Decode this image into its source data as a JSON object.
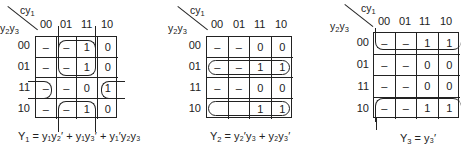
{
  "kmaps": [
    {
      "id": "Y1",
      "col_var": "cy",
      "col_var_sub": "1",
      "row_var_a": "y",
      "row_var_a_sub": "2",
      "row_var_b": "y",
      "row_var_b_sub": "3",
      "col_headers": [
        "00",
        "01",
        "11",
        "10"
      ],
      "row_headers": [
        "00",
        "01",
        "11",
        "10"
      ],
      "cells": [
        [
          "–",
          "–",
          "1",
          "0"
        ],
        [
          "–",
          "–",
          "1",
          "0"
        ],
        [
          "–",
          "–",
          "0",
          "1"
        ],
        [
          "–",
          "–",
          "1",
          "0"
        ]
      ],
      "equation": {
        "lhs": "Y",
        "lhs_sub": "1",
        "terms": [
          "y₁y₂′",
          "y₁y₃′",
          "y₁′y₂y₃"
        ]
      }
    },
    {
      "id": "Y2",
      "col_var": "cy",
      "col_var_sub": "1",
      "row_var_a": "y",
      "row_var_a_sub": "2",
      "row_var_b": "y",
      "row_var_b_sub": "3",
      "col_headers": [
        "00",
        "01",
        "11",
        "10"
      ],
      "row_headers": [
        "00",
        "01",
        "11",
        "10"
      ],
      "cells": [
        [
          "–",
          "–",
          "0",
          "0"
        ],
        [
          "–",
          "–",
          "1",
          "1"
        ],
        [
          "–",
          "–",
          "0",
          "0"
        ],
        [
          "",
          "",
          "1",
          "1"
        ]
      ],
      "equation": {
        "lhs": "Y",
        "lhs_sub": "2",
        "terms": [
          "y₂′y₃",
          "y₂y₃′"
        ]
      }
    },
    {
      "id": "Y3",
      "col_var": "cy",
      "col_var_sub": "1",
      "row_var_a": "y",
      "row_var_a_sub": "2",
      "row_var_b": "y",
      "row_var_b_sub": "3",
      "col_headers": [
        "00",
        "01",
        "11",
        "10"
      ],
      "row_headers": [
        "00",
        "01",
        "11",
        "10"
      ],
      "cells": [
        [
          "–",
          "–",
          "1",
          "1"
        ],
        [
          "–",
          "–",
          "0",
          "0"
        ],
        [
          "–",
          "–",
          "0",
          "0"
        ],
        [
          "–",
          "–",
          "1",
          "1"
        ]
      ],
      "equation": {
        "lhs": "Y",
        "lhs_sub": "3",
        "terms": [
          "y₃′"
        ]
      }
    }
  ],
  "equations_text": {
    "eq1_rhs": "= y₁y₂′ + y₁y₃′ + y₁′y₂y₃",
    "eq2_rhs": "= y₂′y₃ + y₂y₃′",
    "eq3_rhs": "= y₃′"
  }
}
